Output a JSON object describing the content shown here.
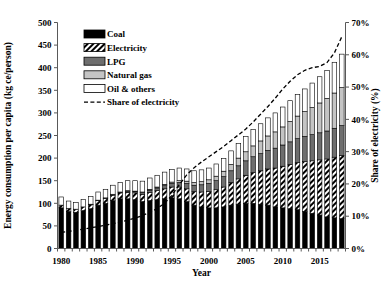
{
  "chart_data": {
    "type": "bar",
    "subtype": "stacked-bar-with-line",
    "title": "",
    "xlabel": "Year",
    "ylabel": "Energy consumption per capita (kg ce/person)",
    "y2label": "Share of electricity (%)",
    "ylim": [
      0,
      500
    ],
    "y2lim": [
      0,
      70
    ],
    "ytick_labels": [
      "0",
      "50",
      "100",
      "150",
      "200",
      "250",
      "300",
      "350",
      "400",
      "450",
      "500"
    ],
    "ytick_values": [
      0,
      50,
      100,
      150,
      200,
      250,
      300,
      350,
      400,
      450,
      500
    ],
    "y2tick_labels": [
      "0%",
      "10%",
      "20%",
      "30%",
      "40%",
      "50%",
      "60%",
      "70%"
    ],
    "y2tick_values": [
      0,
      10,
      20,
      30,
      40,
      50,
      60,
      70
    ],
    "xtick_labels": [
      "1980",
      "1985",
      "1990",
      "1995",
      "2000",
      "2005",
      "2010",
      "2015"
    ],
    "xtick_values": [
      1980,
      1985,
      1990,
      1995,
      2000,
      2005,
      2010,
      2015
    ],
    "grid": false,
    "legend_position": "top-left",
    "categories": [
      1980,
      1981,
      1982,
      1983,
      1984,
      1985,
      1986,
      1987,
      1988,
      1989,
      1990,
      1991,
      1992,
      1993,
      1994,
      1995,
      1996,
      1997,
      1998,
      1999,
      2000,
      2001,
      2002,
      2003,
      2004,
      2005,
      2006,
      2007,
      2008,
      2009,
      2010,
      2011,
      2012,
      2013,
      2014,
      2015,
      2016,
      2017,
      2018
    ],
    "series": [
      {
        "name": "Coal",
        "fill": "solid-black",
        "color": "#000000",
        "values": [
          90,
          82,
          80,
          84,
          88,
          96,
          100,
          106,
          110,
          110,
          108,
          104,
          106,
          108,
          110,
          112,
          110,
          104,
          96,
          92,
          90,
          90,
          92,
          96,
          98,
          100,
          100,
          98,
          96,
          92,
          90,
          88,
          86,
          82,
          78,
          74,
          70,
          68,
          66
        ]
      },
      {
        "name": "Electricity",
        "fill": "diagonal-hatch",
        "color": "#000000",
        "values": [
          6,
          7,
          7,
          8,
          9,
          10,
          11,
          12,
          13,
          14,
          15,
          16,
          18,
          20,
          22,
          24,
          26,
          28,
          30,
          33,
          36,
          40,
          44,
          50,
          56,
          62,
          68,
          74,
          80,
          86,
          92,
          98,
          104,
          110,
          116,
          122,
          128,
          134,
          140
        ]
      },
      {
        "name": "LPG",
        "fill": "dark-gray",
        "color": "#6e6e6e",
        "values": [
          0,
          0,
          0,
          0,
          1,
          1,
          1,
          2,
          2,
          3,
          3,
          4,
          5,
          6,
          7,
          8,
          10,
          12,
          14,
          16,
          18,
          20,
          23,
          26,
          29,
          32,
          35,
          38,
          41,
          44,
          47,
          50,
          53,
          56,
          58,
          60,
          62,
          64,
          66
        ]
      },
      {
        "name": "Natural gas",
        "fill": "light-gray",
        "color": "#bfbfbf",
        "values": [
          0,
          0,
          0,
          0,
          0,
          0,
          0,
          0,
          0,
          1,
          1,
          1,
          2,
          2,
          3,
          3,
          4,
          5,
          6,
          7,
          8,
          10,
          12,
          14,
          17,
          20,
          24,
          28,
          32,
          36,
          40,
          45,
          50,
          55,
          60,
          66,
          72,
          78,
          84
        ]
      },
      {
        "name": "Oil & others",
        "fill": "white",
        "color": "#ffffff",
        "values": [
          18,
          16,
          15,
          16,
          17,
          18,
          19,
          20,
          21,
          22,
          23,
          24,
          25,
          26,
          27,
          28,
          28,
          27,
          26,
          26,
          26,
          27,
          28,
          30,
          32,
          34,
          36,
          38,
          40,
          42,
          44,
          46,
          48,
          50,
          54,
          58,
          62,
          68,
          74
        ]
      }
    ],
    "line_series": {
      "name": "Share of electricity",
      "style": "dashed",
      "color": "#000000",
      "axis": "secondary",
      "unit": "%",
      "values": [
        5.0,
        5.3,
        5.6,
        6.0,
        6.4,
        6.8,
        7.2,
        7.7,
        8.2,
        8.8,
        9.4,
        10.2,
        11.2,
        12.4,
        14.0,
        16.5,
        19.8,
        22.8,
        25.0,
        26.8,
        28.4,
        30.0,
        31.6,
        33.4,
        35.2,
        37.0,
        39.2,
        41.6,
        44.0,
        46.6,
        49.4,
        51.8,
        53.8,
        55.2,
        56.0,
        56.4,
        57.6,
        60.6,
        65.6
      ]
    }
  }
}
